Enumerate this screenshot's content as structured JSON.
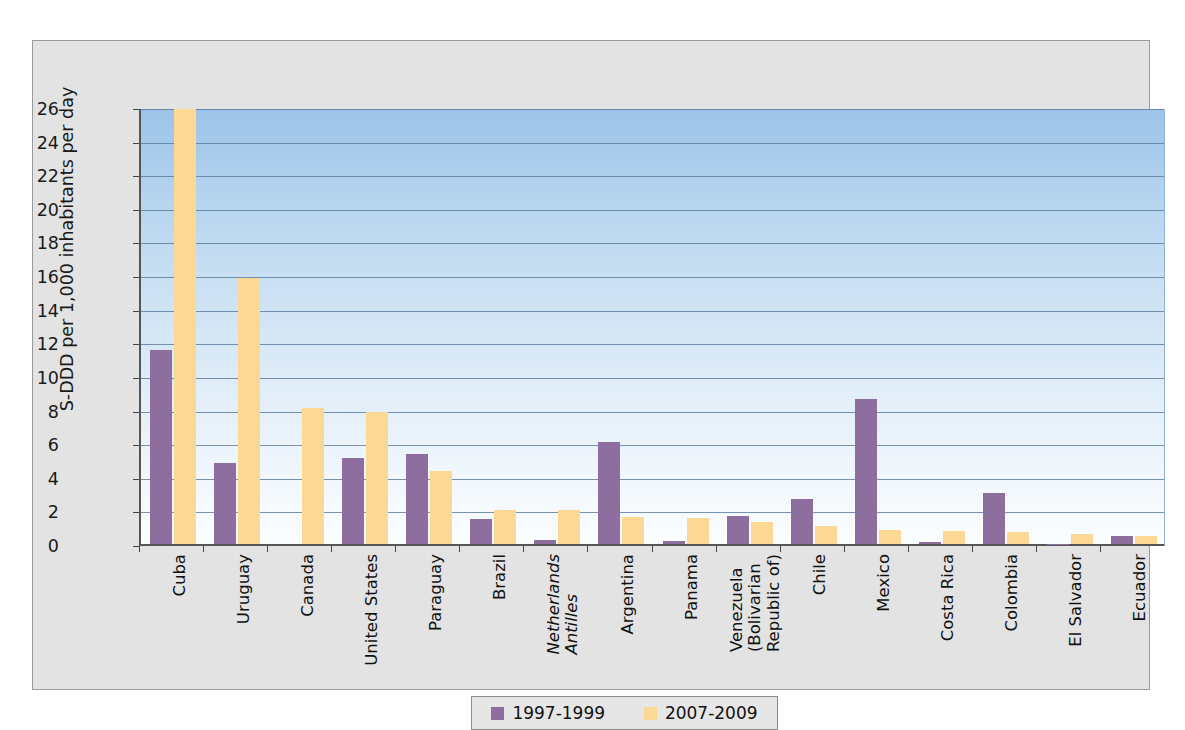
{
  "chart_data": {
    "type": "bar",
    "title": "",
    "xlabel": "",
    "ylabel": "S-DDD per 1,000 inhabitants per day",
    "ylim": [
      0,
      26
    ],
    "ytick_step": 2,
    "yticks": [
      0,
      2,
      4,
      6,
      8,
      10,
      12,
      14,
      16,
      18,
      20,
      22,
      24,
      26
    ],
    "grid": true,
    "legend_position": "bottom",
    "categories": [
      "Cuba",
      "Uruguay",
      "Canada",
      "United States",
      "Paraguay",
      "Brazil",
      "Netherlands Antilles",
      "Argentina",
      "Panama",
      "Venezuela (Bolivarian Republic of)",
      "Chile",
      "Mexico",
      "Costa Rica",
      "Colombia",
      "El Salvador",
      "Ecuador"
    ],
    "category_lines": [
      [
        "Cuba"
      ],
      [
        "Uruguay"
      ],
      [
        "Canada"
      ],
      [
        "United States"
      ],
      [
        "Paraguay"
      ],
      [
        "Brazil"
      ],
      [
        "Netherlands",
        "Antilles"
      ],
      [
        "Argentina"
      ],
      [
        "Panama"
      ],
      [
        "Venezuela",
        "(Bolivarian",
        "Republic of)"
      ],
      [
        "Chile"
      ],
      [
        "Mexico"
      ],
      [
        "Costa Rica"
      ],
      [
        "Colombia"
      ],
      [
        "El Salvador"
      ],
      [
        "Ecuador"
      ]
    ],
    "category_italic": [
      false,
      false,
      false,
      false,
      false,
      false,
      true,
      false,
      false,
      false,
      false,
      false,
      false,
      false,
      false,
      false
    ],
    "series": [
      {
        "name": "1997-1999",
        "color": "#8e6d9f",
        "values": [
          11.55,
          4.8,
          0,
          5.1,
          5.35,
          1.5,
          0.25,
          6.05,
          0.15,
          1.65,
          2.7,
          8.65,
          0.12,
          3.05,
          0.03,
          0.45
        ]
      },
      {
        "name": "2007-2009",
        "color": "#fbd894",
        "values": [
          25.9,
          15.85,
          8.1,
          7.85,
          4.35,
          2.0,
          2.05,
          1.6,
          1.55,
          1.3,
          1.05,
          0.85,
          0.8,
          0.7,
          0.6,
          0.5
        ]
      }
    ]
  },
  "legend": {
    "items": [
      {
        "label": "1997-1999",
        "color": "#8e6d9f"
      },
      {
        "label": "2007-2009",
        "color": "#fbd894"
      }
    ]
  }
}
